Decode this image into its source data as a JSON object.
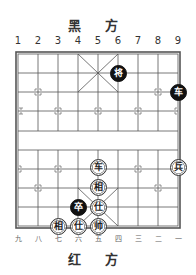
{
  "header": {
    "title": "黑 方"
  },
  "footer": {
    "title": "红 方"
  },
  "column_labels_top": [
    "1",
    "2",
    "3",
    "4",
    "5",
    "6",
    "7",
    "8",
    "9"
  ],
  "column_labels_bottom": [
    "九",
    "八",
    "七",
    "六",
    "五",
    "四",
    "三",
    "二",
    "一"
  ],
  "board": {
    "columns": 9,
    "rows": 10,
    "line_color": "#555555",
    "background": "#ffffff"
  },
  "colors": {
    "black_piece": "#111111",
    "red_piece_bg": "#ffffff",
    "red_piece_border": "#333333"
  },
  "pieces": [
    {
      "side": "black",
      "name": "将",
      "col": 6,
      "row": 1
    },
    {
      "side": "black",
      "name": "车",
      "col": 9,
      "row": 2
    },
    {
      "side": "red",
      "name": "车",
      "col": 5,
      "row": 6
    },
    {
      "side": "red",
      "name": "兵",
      "col": 9,
      "row": 6
    },
    {
      "side": "red",
      "name": "相",
      "col": 5,
      "row": 7
    },
    {
      "side": "black",
      "name": "卒",
      "col": 4,
      "row": 8
    },
    {
      "side": "red",
      "name": "仕",
      "col": 5,
      "row": 8
    },
    {
      "side": "red",
      "name": "相",
      "col": 3,
      "row": 9
    },
    {
      "side": "red",
      "name": "仕",
      "col": 4,
      "row": 9
    },
    {
      "side": "red",
      "name": "帅",
      "col": 5,
      "row": 9
    }
  ]
}
